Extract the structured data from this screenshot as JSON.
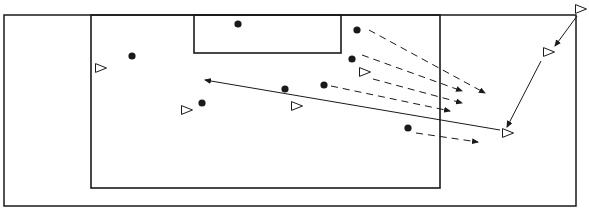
{
  "diagram": {
    "type": "soccer-drill",
    "colors": {
      "line": "#1a1a1a",
      "background": "#ffffff"
    },
    "field": {
      "x1": 4,
      "y1": 15,
      "x2": 576,
      "y2": 206
    },
    "penalty_area": {
      "x1": 91,
      "y1": 15,
      "x2": 440,
      "y2": 188
    },
    "goal_area": {
      "x1": 194,
      "y1": 15,
      "x2": 341,
      "y2": 53
    },
    "players_dot": [
      {
        "x": 238,
        "y": 24
      },
      {
        "x": 132,
        "y": 56
      },
      {
        "x": 357,
        "y": 30
      },
      {
        "x": 352,
        "y": 59
      },
      {
        "x": 324,
        "y": 85
      },
      {
        "x": 285,
        "y": 89
      },
      {
        "x": 202,
        "y": 103
      },
      {
        "x": 408,
        "y": 128
      }
    ],
    "players_triangle": [
      {
        "x": 101,
        "y": 68
      },
      {
        "x": 365,
        "y": 72
      },
      {
        "x": 297,
        "y": 106
      },
      {
        "x": 187,
        "y": 110
      },
      {
        "x": 549,
        "y": 52
      },
      {
        "x": 508,
        "y": 133
      },
      {
        "x": 581,
        "y": 9
      }
    ],
    "dashed_arrows": [
      {
        "x1": 369,
        "y1": 30,
        "x2": 485,
        "y2": 93
      },
      {
        "x1": 362,
        "y1": 55,
        "x2": 462,
        "y2": 91
      },
      {
        "x1": 373,
        "y1": 79,
        "x2": 462,
        "y2": 103
      },
      {
        "x1": 331,
        "y1": 86,
        "x2": 450,
        "y2": 111
      },
      {
        "x1": 416,
        "y1": 133,
        "x2": 478,
        "y2": 142
      }
    ],
    "solid_arrows": [
      {
        "x1": 500,
        "y1": 130,
        "x2": 205,
        "y2": 80
      },
      {
        "x1": 577,
        "y1": 16,
        "x2": 555,
        "y2": 46
      },
      {
        "x1": 541,
        "y1": 61,
        "x2": 507,
        "y2": 127
      }
    ]
  }
}
